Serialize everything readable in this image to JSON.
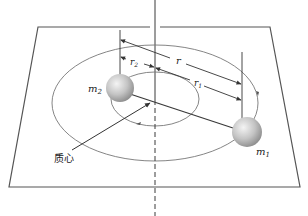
{
  "figure": {
    "labels": {
      "mass1": "m",
      "mass1_sub": "1",
      "mass2": "m",
      "mass2_sub": "2",
      "r": "r",
      "r1": "r",
      "r1_sub": "1",
      "r2": "r",
      "r2_sub": "2",
      "center_of_mass": "质心"
    },
    "colors": {
      "line": "#3a3a3a",
      "orbit": "#6a6a6a",
      "sphere_light": "#f2f2f2",
      "sphere_dark": "#8c8c8c"
    }
  }
}
